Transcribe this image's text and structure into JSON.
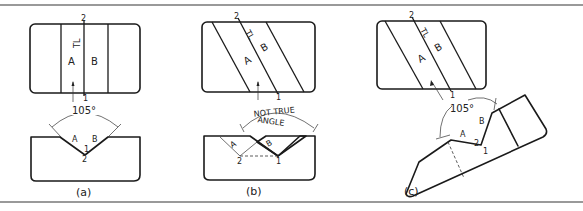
{
  "figure": {
    "panels": [
      {
        "id": "a",
        "caption": "(a)",
        "top_view": {
          "face_a": "A",
          "face_b": "B",
          "true_length": "TL",
          "point_top": "2",
          "point_bottom": "1"
        },
        "front_view": {
          "angle": "105°",
          "face_a": "A",
          "face_b": "B",
          "point_1": "1",
          "point_2": "2"
        }
      },
      {
        "id": "b",
        "caption": "(b)",
        "top_view": {
          "face_a": "A",
          "face_b": "B",
          "true_length": "TL",
          "point_top": "2",
          "point_bottom": "1"
        },
        "front_view": {
          "angle_note_line1": "NOT TRUE",
          "angle_note_line2": "ANGLE",
          "face_a": "A",
          "face_b": "B",
          "point_1": "1",
          "point_2": "2"
        }
      },
      {
        "id": "c",
        "caption": "(c)",
        "top_view": {
          "face_a": "A",
          "face_b": "B",
          "true_length": "TL",
          "point_top": "2",
          "point_bottom": "1"
        },
        "aux_view": {
          "angle": "105°",
          "face_a": "A",
          "face_b": "B",
          "point_1": "1",
          "point_2": "2"
        }
      }
    ]
  }
}
